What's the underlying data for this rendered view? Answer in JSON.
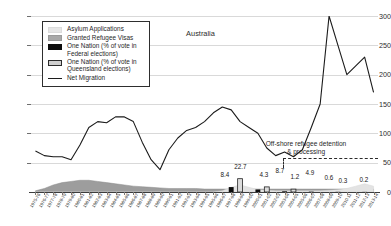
{
  "chart_data": {
    "type": "line",
    "title": "Australia",
    "xlabel": "",
    "ylabel": "",
    "ylim": [
      0,
      300
    ],
    "yticks": [
      0,
      50,
      100,
      150,
      200,
      250,
      300
    ],
    "grid": true,
    "legend_position": "top-left",
    "legend": [
      {
        "label": "Asylum Applications",
        "swatch": "area-light-grey"
      },
      {
        "label": "Granted Refugee Visas",
        "swatch": "area-mid-grey"
      },
      {
        "label": "One Nation (% of vote in Federal elections)",
        "swatch": "bar-black"
      },
      {
        "label": "One Nation (% of vote in Queensland elections)",
        "swatch": "bar-outlined-grey"
      },
      {
        "label": "Net Migration",
        "swatch": "line-black"
      }
    ],
    "categories": [
      "1975-76",
      "1976-77",
      "1977-78",
      "1978-79",
      "1979-80",
      "1980-81",
      "1981-82",
      "1982-83",
      "1983-84",
      "1984-85",
      "1985-86",
      "1986-87",
      "1987-88",
      "1988-89",
      "1989-90",
      "1990-91",
      "1991-92",
      "1992-93",
      "1993-94",
      "1994-95",
      "1995-96",
      "1996-97",
      "1997-98",
      "1998-99",
      "1999-00",
      "2000-01",
      "2001-02",
      "2002-03",
      "2003-04",
      "2004-05",
      "2005-06",
      "2006-07",
      "2007-08",
      "2008-09",
      "2009-10",
      "2010-11",
      "2011-12",
      "2012-13",
      "2013-14"
    ],
    "series": [
      {
        "name": "Net Migration",
        "unit": "thousands",
        "values": [
          70,
          62,
          60,
          60,
          55,
          80,
          110,
          120,
          118,
          128,
          128,
          120,
          85,
          55,
          38,
          72,
          92,
          105,
          110,
          120,
          135,
          145,
          140,
          120,
          110,
          100,
          75,
          62,
          68,
          60,
          72,
          110,
          150,
          300,
          250,
          200,
          215,
          230,
          170
        ]
      },
      {
        "name": "Asylum Applications",
        "unit": "thousands",
        "values": [
          0,
          0,
          0,
          0,
          0,
          0,
          0,
          0,
          0,
          0,
          0,
          0,
          0,
          0,
          0,
          0,
          0,
          0,
          0,
          0,
          0,
          2,
          8,
          12,
          8,
          4,
          3,
          2,
          2,
          2,
          2,
          2,
          2,
          3,
          4,
          6,
          10,
          14,
          10
        ]
      },
      {
        "name": "Granted Refugee Visas",
        "unit": "thousands",
        "values": [
          2,
          6,
          12,
          16,
          18,
          20,
          20,
          18,
          16,
          14,
          12,
          10,
          9,
          8,
          7,
          6,
          6,
          6,
          6,
          5,
          5,
          5,
          5,
          5,
          5,
          5,
          5,
          5,
          5,
          5,
          5,
          5,
          5,
          5,
          5,
          5,
          5,
          5,
          5
        ]
      },
      {
        "name": "One Nation (% of vote in Federal elections)",
        "unit": "percent",
        "bars": [
          {
            "category": "1997-98",
            "value": 8.4
          },
          {
            "category": "2000-01",
            "value": 4.3
          },
          {
            "category": "2003-04",
            "value": 1.2
          },
          {
            "category": "2006-07",
            "value": 0.6
          },
          {
            "category": "2009-10",
            "value": 0.3
          },
          {
            "category": "2012-13",
            "value": 0.2
          }
        ]
      },
      {
        "name": "One Nation (% of vote in Queensland elections)",
        "unit": "percent",
        "bars": [
          {
            "category": "1998-99",
            "value": 22.7
          },
          {
            "category": "2001-02",
            "value": 8.7
          },
          {
            "category": "2004-05",
            "value": 4.9
          }
        ]
      }
    ],
    "data_labels": [
      "8.4",
      "22.7",
      "4.3",
      "8.7",
      "1.2",
      "4.9",
      "0.6",
      "0.3",
      "0.2"
    ],
    "annotations": [
      {
        "text_line1": "Off-shore refugee detention",
        "text_line2": "& processing",
        "style": "dashed-bracket"
      }
    ]
  },
  "axis": {
    "y_labels": [
      "300",
      "250",
      "200",
      "150",
      "100",
      "50",
      "0"
    ]
  },
  "labels": {
    "l0": "8.4",
    "l1": "22.7",
    "l2": "4.3",
    "l3": "8.7",
    "l4": "1.2",
    "l5": "4.9",
    "l6": "0.6",
    "l7": "0.3",
    "l8": "0.2"
  },
  "annotation": {
    "line1": "Off-shore refugee detention",
    "line2": "& processing"
  },
  "legend_items": {
    "i0": "Asylum Applications",
    "i1": "Granted Refugee Visas",
    "i2a": "One Nation (% of vote in",
    "i2b": "Federal elections)",
    "i3a": "One Nation (% of vote in",
    "i3b": "Queensland elections)",
    "i4": "Net Migration"
  },
  "title": {
    "text": "Australia"
  }
}
